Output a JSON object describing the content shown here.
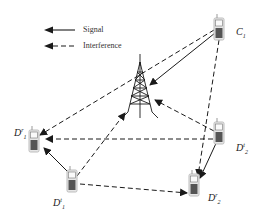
{
  "legend": {
    "signal_label": "Signal",
    "interference_label": "Interference"
  },
  "nodes": {
    "base_station": {
      "label": "",
      "icon": "cell-tower-icon"
    },
    "cellular_user": {
      "base": "C",
      "sub": "1",
      "sup": ""
    },
    "d2d_rx_1": {
      "base": "D",
      "sub": "1",
      "sup": "r"
    },
    "d2d_tx_1": {
      "base": "D",
      "sub": "1",
      "sup": "t"
    },
    "d2d_tx_2": {
      "base": "D",
      "sub": "2",
      "sup": "t"
    },
    "d2d_rx_2": {
      "base": "D",
      "sub": "2",
      "sup": "r"
    }
  },
  "links": [
    {
      "from": "C1",
      "to": "BS",
      "type": "signal"
    },
    {
      "from": "Dt1",
      "to": "Dr1",
      "type": "signal"
    },
    {
      "from": "Dt2",
      "to": "Dr2",
      "type": "signal"
    },
    {
      "from": "C1",
      "to": "Dr1",
      "type": "interference"
    },
    {
      "from": "C1",
      "to": "Dr2",
      "type": "interference"
    },
    {
      "from": "Dt2",
      "to": "Dr1",
      "type": "interference"
    },
    {
      "from": "Dt2",
      "to": "BS",
      "type": "interference"
    },
    {
      "from": "Dt1",
      "to": "BS",
      "type": "interference"
    },
    {
      "from": "Dt1",
      "to": "Dr2",
      "type": "interference"
    }
  ],
  "colors": {
    "line": "#222222",
    "phone_body": "#8a8a8a",
    "phone_edge": "#cfcfcf"
  }
}
